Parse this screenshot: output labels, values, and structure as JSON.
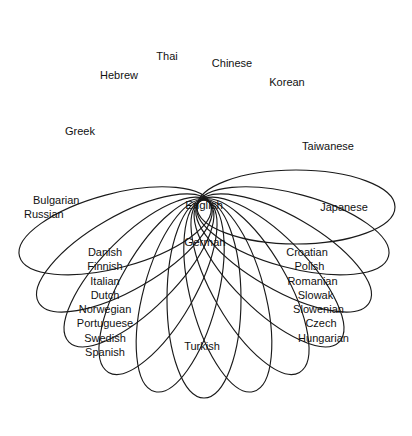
{
  "diagram": {
    "type": "rosette-ellipse-petal-diagram",
    "background_color": "#ffffff",
    "stroke_color": "#1a1a1a",
    "text_color": "#111111",
    "center": {
      "x": 204,
      "y": 207
    },
    "core": {
      "label": "English",
      "sub_label": "German"
    },
    "petals": [
      {
        "id": "thai",
        "label": "Thai",
        "angle_deg": -75,
        "label_x": 167,
        "label_y": 57
      },
      {
        "id": "chinese",
        "label": "Chinese",
        "angle_deg": -60,
        "label_x": 232,
        "label_y": 64
      },
      {
        "id": "korean",
        "label": "Korean",
        "angle_deg": -45,
        "label_x": 287,
        "label_y": 83
      },
      {
        "id": "hebrew",
        "label": "Hebrew",
        "angle_deg": -105,
        "label_x": 119,
        "label_y": 76
      },
      {
        "id": "greek",
        "label": "Greek",
        "angle_deg": -120,
        "label_x": 80,
        "label_y": 132
      },
      {
        "id": "taiwanese",
        "label": "Taiwanese",
        "angle_deg": -30,
        "label_x": 328,
        "label_y": 147
      },
      {
        "id": "japanese",
        "label": "Japanese",
        "angle_deg": 0,
        "label_x": 344,
        "label_y": 208
      },
      {
        "id": "turkish",
        "label": "Turkish",
        "angle_deg": 90,
        "label_x": 202,
        "label_y": 347
      }
    ],
    "petal_groups": [
      {
        "id": "slavic-west",
        "label": "Bulgarian / Russian",
        "angle_deg": 180,
        "x": 33,
        "y": 193,
        "align": "left",
        "items": [
          "Bulgarian",
          "Russian"
        ]
      },
      {
        "id": "western-european",
        "label": "Western European languages",
        "angle_deg": 120,
        "x": 62,
        "y": 245,
        "align": "center",
        "items": [
          "Danish",
          "Finnish",
          "Italian",
          "Dutch",
          "Norwegian",
          "Portuguese",
          "Swedish",
          "Spanish"
        ]
      },
      {
        "id": "central-eastern-european",
        "label": "Central and Eastern European languages",
        "angle_deg": 60,
        "x": 272,
        "y": 245,
        "align": "center",
        "items": [
          "Croatian",
          "Polish",
          "Romanian",
          "Slowak",
          "Slowenian",
          "Czech",
          "Hungarian"
        ]
      }
    ],
    "ellipse_geometry": {
      "count": 12,
      "semi_major": 99,
      "semi_minor": 37,
      "offset_from_center": 92,
      "angles_deg": [
        0,
        15,
        30,
        45,
        60,
        75,
        90,
        105,
        120,
        135,
        150,
        165
      ]
    }
  }
}
